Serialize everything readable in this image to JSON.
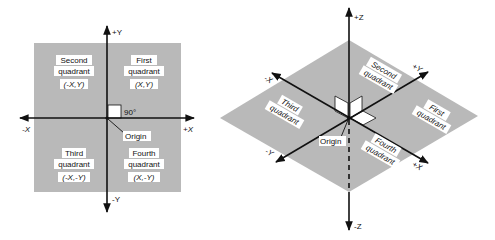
{
  "colors": {
    "plane": "#b9b9b9",
    "axis": "#111111",
    "label_bg": "#ffffff",
    "background": "#ffffff"
  },
  "diagram_2d": {
    "axes": {
      "pos_y": "+Y",
      "neg_y": "-Y",
      "pos_x": "+X",
      "neg_x": "-X"
    },
    "right_angle_label": "90°",
    "origin_label": "Origin",
    "quadrants": {
      "first": {
        "line1": "First",
        "line2": "quadrant",
        "coords": "(X,Y)"
      },
      "second": {
        "line1": "Second",
        "line2": "quadrant",
        "coords": "(-X,Y)"
      },
      "third": {
        "line1": "Third",
        "line2": "quadrant",
        "coords": "(-X,-Y)"
      },
      "fourth": {
        "line1": "Fourth",
        "line2": "quadrant",
        "coords": "(X,-Y)"
      }
    }
  },
  "diagram_3d": {
    "axes": {
      "pos_z": "+Z",
      "neg_z": "-Z",
      "pos_y": "+Y",
      "neg_y": "-Y",
      "pos_x": "+X",
      "neg_x": "-X"
    },
    "origin_label": "Origin",
    "quadrants": {
      "first": {
        "line1": "First",
        "line2": "quadrant"
      },
      "second": {
        "line1": "Second",
        "line2": "quadrant"
      },
      "third": {
        "line1": "Third",
        "line2": "quadrant"
      },
      "fourth": {
        "line1": "Fourth",
        "line2": "quadrant"
      }
    }
  }
}
